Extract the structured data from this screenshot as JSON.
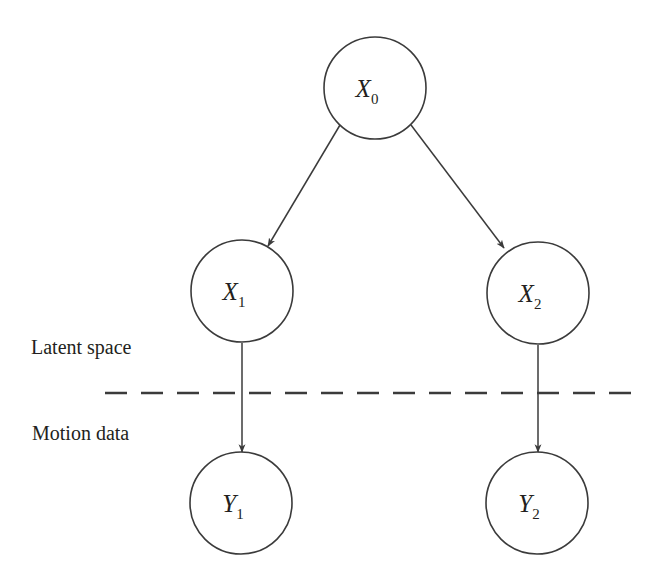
{
  "figure": {
    "width": 660,
    "height": 587,
    "background_color": "#ffffff",
    "stroke_color": "#3b3b3b",
    "text_color": "#231f20"
  },
  "region_labels": {
    "latent_space": "Latent space",
    "motion_data": "Motion data"
  },
  "divider": {
    "style": "dashed",
    "x_start": 105,
    "x_end": 636,
    "y": 393
  },
  "nodes": [
    {
      "id": "X0",
      "base": "X",
      "subscript": "0",
      "label": "X0",
      "cx": 375,
      "cy": 88,
      "r": 51,
      "layer": "latent"
    },
    {
      "id": "X1",
      "base": "X",
      "subscript": "1",
      "label": "X1",
      "cx": 242,
      "cy": 291,
      "r": 51,
      "layer": "latent"
    },
    {
      "id": "X2",
      "base": "X",
      "subscript": "2",
      "label": "X2",
      "cx": 538,
      "cy": 293,
      "r": 51,
      "layer": "latent"
    },
    {
      "id": "Y1",
      "base": "Y",
      "subscript": "1",
      "label": "Y1",
      "cx": 241,
      "cy": 503,
      "r": 51,
      "layer": "motion"
    },
    {
      "id": "Y2",
      "base": "Y",
      "subscript": "2",
      "label": "Y2",
      "cx": 537,
      "cy": 503,
      "r": 51,
      "layer": "motion"
    }
  ],
  "edges": [
    {
      "id": "X0-X1",
      "from": "X0",
      "to": "X1",
      "kind": "diagonal",
      "arrow": true,
      "x1": 340,
      "y1": 125,
      "x2": 268,
      "y2": 246
    },
    {
      "id": "X0-X2",
      "from": "X0",
      "to": "X2",
      "kind": "diagonal",
      "arrow": true,
      "x1": 411,
      "y1": 125,
      "x2": 504,
      "y2": 248
    },
    {
      "id": "X1-Y1",
      "from": "X1",
      "to": "Y1",
      "kind": "vertical",
      "arrow": true,
      "x1": 242,
      "y1": 343,
      "x2": 242,
      "y2": 452
    },
    {
      "id": "X2-Y2",
      "from": "X2",
      "to": "Y2",
      "kind": "vertical",
      "arrow": true,
      "x1": 538,
      "y1": 345,
      "x2": 538,
      "y2": 452
    }
  ]
}
